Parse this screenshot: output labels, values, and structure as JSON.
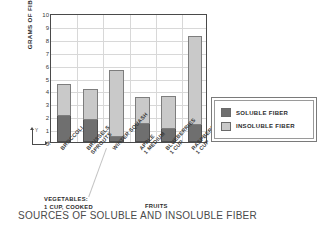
{
  "chart_data": {
    "type": "bar",
    "subtype": "stacked",
    "title": "SOURCES OF SOLUBLE AND INSOLUBLE FIBER",
    "xlabel": "",
    "ylabel": "GRAMS OF FIBER",
    "ylim": [
      0,
      10
    ],
    "yticks": [
      0,
      1,
      2,
      3,
      4,
      5,
      6,
      7,
      8,
      9,
      10
    ],
    "grid": true,
    "legend_position": "right",
    "categories": [
      "BROCCOLI",
      "BRUSSELS SPROUTS",
      "WINTER SQUASH",
      "APPLE 1 MEDIUM",
      "BLUEBERRIES 1 CUP",
      "RASPBERRIES 1 CUP"
    ],
    "category_lines": [
      [
        "BROCCOLI"
      ],
      [
        "BRUSSELS",
        "SPROUTS"
      ],
      [
        "WINTER SQUASH"
      ],
      [
        "APPLE",
        "1 MEDIUM"
      ],
      [
        "BLUEBERRIES",
        "1 CUP"
      ],
      [
        "RASPBERRIES",
        "1 CUP"
      ]
    ],
    "series": [
      {
        "name": "SOLUBLE FIBER",
        "color": "#6f6f6f",
        "values": [
          2.0,
          1.7,
          0.4,
          1.4,
          1.0,
          1.3
        ]
      },
      {
        "name": "INSOLUBLE FIBER",
        "color": "#c9c9c9",
        "values": [
          2.5,
          2.4,
          5.2,
          2.1,
          2.6,
          6.9
        ]
      }
    ],
    "totals": [
      4.5,
      4.1,
      5.6,
      3.5,
      3.6,
      8.2
    ],
    "groups": [
      {
        "label_lines": [
          "VEGETABLES:",
          "1 CUP, COOKED"
        ],
        "categories": [
          0,
          1,
          2
        ]
      },
      {
        "label_lines": [
          "FRUITS"
        ],
        "categories": [
          3,
          4,
          5
        ]
      }
    ]
  },
  "legend": {
    "items": [
      {
        "label": "SOLUBLE FIBER",
        "color": "#6f6f6f"
      },
      {
        "label": "INSOLUBLE FIBER",
        "color": "#c9c9c9"
      }
    ]
  },
  "axis_icon": {
    "y_label": "Y",
    "x_label": "X"
  }
}
